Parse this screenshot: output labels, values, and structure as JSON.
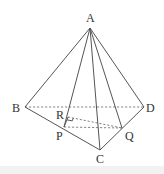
{
  "figure": {
    "type": "tetrahedron-geometry-diagram",
    "points": {
      "A": {
        "label": "A",
        "x": 90,
        "y": 28,
        "lx": 86,
        "ly": 22
      },
      "B": {
        "label": "B",
        "x": 25,
        "y": 107,
        "lx": 12,
        "ly": 112
      },
      "C": {
        "label": "C",
        "x": 100,
        "y": 150,
        "lx": 96,
        "ly": 163
      },
      "D": {
        "label": "D",
        "x": 144,
        "y": 107,
        "lx": 146,
        "ly": 112
      },
      "P": {
        "label": "P",
        "x": 64,
        "y": 127,
        "lx": 56,
        "ly": 140
      },
      "Q": {
        "label": "Q",
        "x": 122,
        "y": 128,
        "lx": 125,
        "ly": 140
      },
      "R": {
        "label": "R",
        "x": 68,
        "y": 117,
        "lx": 56,
        "ly": 119
      }
    },
    "solid_edges": [
      [
        "A",
        "B"
      ],
      [
        "A",
        "D"
      ],
      [
        "A",
        "C"
      ],
      [
        "A",
        "P"
      ],
      [
        "A",
        "Q"
      ],
      [
        "B",
        "C"
      ],
      [
        "C",
        "D"
      ],
      [
        "P",
        "R"
      ]
    ],
    "dashed_edges": [
      [
        "B",
        "D"
      ],
      [
        "R",
        "Q"
      ],
      [
        "P",
        "Q"
      ]
    ],
    "right_angle_marker": {
      "at": "R",
      "between": [
        "P",
        "Q"
      ]
    },
    "colors": {
      "stroke": "#555555",
      "dashed": "#777777",
      "text": "#333333",
      "background": "#ffffff"
    }
  }
}
